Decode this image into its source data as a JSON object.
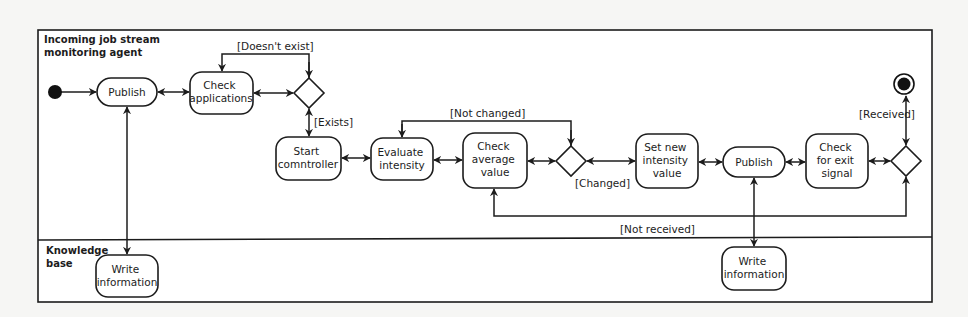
{
  "diagram": {
    "type": "uml-activity-diagram",
    "colors": {
      "line": "#1c1c1c",
      "node_fill": "#ffffff",
      "background": "#f6f6f4"
    },
    "swimlanes": [
      {
        "id": "agent",
        "label_lines": [
          "Incoming job stream",
          "monitoring agent"
        ]
      },
      {
        "id": "kb",
        "label_lines": [
          "Knowledge",
          "base"
        ]
      }
    ],
    "nodes": [
      {
        "id": "start",
        "kind": "initial",
        "lane": "agent"
      },
      {
        "id": "publish1",
        "kind": "action",
        "lane": "agent",
        "label_lines": [
          "Publish"
        ]
      },
      {
        "id": "check_apps",
        "kind": "action",
        "lane": "agent",
        "label_lines": [
          "Check",
          "applications"
        ]
      },
      {
        "id": "dec_exists",
        "kind": "decision",
        "lane": "agent"
      },
      {
        "id": "start_ctrl",
        "kind": "action",
        "lane": "agent",
        "label_lines": [
          "Start",
          "comntroller"
        ]
      },
      {
        "id": "eval_intensity",
        "kind": "action",
        "lane": "agent",
        "label_lines": [
          "Evaluate",
          "intensity"
        ]
      },
      {
        "id": "check_avg",
        "kind": "action",
        "lane": "agent",
        "label_lines": [
          "Check",
          "average",
          "value"
        ]
      },
      {
        "id": "dec_changed",
        "kind": "decision",
        "lane": "agent"
      },
      {
        "id": "set_intensity",
        "kind": "action",
        "lane": "agent",
        "label_lines": [
          "Set new",
          "intensity",
          "value"
        ]
      },
      {
        "id": "publish2",
        "kind": "action",
        "lane": "agent",
        "label_lines": [
          "Publish"
        ]
      },
      {
        "id": "check_exit",
        "kind": "action",
        "lane": "agent",
        "label_lines": [
          "Check",
          "for exit",
          "signal"
        ]
      },
      {
        "id": "dec_received",
        "kind": "decision",
        "lane": "agent"
      },
      {
        "id": "end",
        "kind": "final",
        "lane": "agent"
      },
      {
        "id": "write1",
        "kind": "action",
        "lane": "kb",
        "label_lines": [
          "Write",
          "information"
        ]
      },
      {
        "id": "write2",
        "kind": "action",
        "lane": "kb",
        "label_lines": [
          "Write",
          "information"
        ]
      }
    ],
    "guards": {
      "doesnt_exist": "[Doesn't exist]",
      "exists": "[Exists]",
      "not_changed": "[Not changed]",
      "changed": "[Changed]",
      "received": "[Received]",
      "not_received": "[Not received]"
    },
    "edges": [
      {
        "from": "start",
        "to": "publish1"
      },
      {
        "from": "publish1",
        "to": "check_apps",
        "bidirectional": true
      },
      {
        "from": "check_apps",
        "to": "dec_exists",
        "bidirectional": true
      },
      {
        "from": "dec_exists",
        "to": "check_apps",
        "guard": "[Doesn't exist]"
      },
      {
        "from": "dec_exists",
        "to": "start_ctrl",
        "guard": "[Exists]",
        "bidirectional": true
      },
      {
        "from": "start_ctrl",
        "to": "eval_intensity",
        "bidirectional": true
      },
      {
        "from": "eval_intensity",
        "to": "check_avg",
        "bidirectional": true
      },
      {
        "from": "check_avg",
        "to": "dec_changed",
        "bidirectional": true
      },
      {
        "from": "dec_changed",
        "to": "eval_intensity",
        "guard": "[Not changed]"
      },
      {
        "from": "dec_changed",
        "to": "set_intensity",
        "guard": "[Changed]",
        "bidirectional": true
      },
      {
        "from": "set_intensity",
        "to": "publish2",
        "bidirectional": true
      },
      {
        "from": "publish2",
        "to": "check_exit",
        "bidirectional": true
      },
      {
        "from": "check_exit",
        "to": "dec_received",
        "bidirectional": true
      },
      {
        "from": "dec_received",
        "to": "end",
        "guard": "[Received]",
        "bidirectional": true
      },
      {
        "from": "dec_received",
        "to": "check_avg",
        "guard": "[Not received]"
      },
      {
        "from": "write1",
        "to": "publish1",
        "bidirectional": true
      },
      {
        "from": "publish2",
        "to": "write2",
        "bidirectional": true
      }
    ]
  }
}
